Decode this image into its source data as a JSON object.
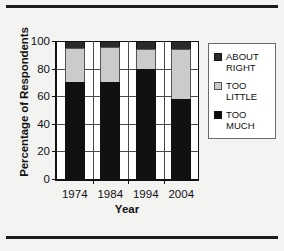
{
  "page": {
    "background_color": "#f3f3f1",
    "rule_color": "#1b1b1b"
  },
  "legend": {
    "position": "right",
    "items": [
      {
        "label": "ABOUT\nRIGHT",
        "key": "about_right",
        "color": "#2b2b2b",
        "swatch_name": "about-right-swatch"
      },
      {
        "label": "TOO\nLITTLE",
        "key": "too_little",
        "color": "#cbcbcb",
        "swatch_name": "too-little-swatch"
      },
      {
        "label": "TOO\nMUCH",
        "key": "too_much",
        "color": "#0a0a0a",
        "swatch_name": "too-much-swatch"
      }
    ]
  },
  "chart_data": {
    "type": "bar",
    "subtype": "stacked",
    "title": "",
    "xlabel": "Year",
    "ylabel": "Percentage of Respondents",
    "categories": [
      "1974",
      "1984",
      "1994",
      "2004"
    ],
    "ylim": [
      0,
      100
    ],
    "yticks": [
      0,
      20,
      40,
      60,
      80,
      100
    ],
    "ytick_labels": [
      "0",
      "20",
      "40",
      "60",
      "80",
      "100"
    ],
    "grid": true,
    "grid_axis": "y",
    "legend_position": "right",
    "stack_order_bottom_to_top": [
      "TOO MUCH",
      "TOO LITTLE",
      "ABOUT RIGHT"
    ],
    "series": [
      {
        "name": "TOO MUCH",
        "color": "#0a0a0a",
        "values": [
          70,
          70,
          80,
          58
        ]
      },
      {
        "name": "TOO LITTLE",
        "color": "#cbcbcb",
        "values": [
          25,
          26,
          14,
          36
        ]
      },
      {
        "name": "ABOUT RIGHT",
        "color": "#2b2b2b",
        "values": [
          5,
          4,
          6,
          6
        ]
      }
    ]
  }
}
